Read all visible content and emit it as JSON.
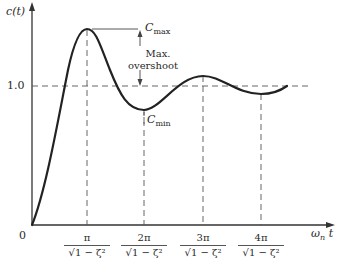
{
  "diagram": {
    "y_axis_label": "c(t)",
    "x_axis_label": "ω",
    "x_axis_label_sub": "n",
    "x_axis_label_var": "t",
    "origin_label": "0",
    "reference_level_label": "1.0",
    "cmax_label": "C",
    "cmax_sub": "max",
    "cmin_label": "C",
    "cmin_sub": "min",
    "overshoot_label_line1": "Max.",
    "overshoot_label_line2": "overshoot",
    "x_ticks": [
      {
        "num": "π",
        "den": "√1 − ζ²"
      },
      {
        "num": "2π",
        "den": "√1 − ζ²"
      },
      {
        "num": "3π",
        "den": "√1 − ζ²"
      },
      {
        "num": "4π",
        "den": "√1 − ζ²"
      }
    ]
  },
  "colors": {
    "curve": "#222222",
    "dashed": "#555555",
    "axis": "#333333"
  }
}
